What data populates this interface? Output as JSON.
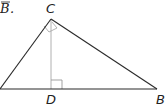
{
  "caption_fragment": {
    "letter": "B",
    "punct": "."
  },
  "points": {
    "C": {
      "label": "C"
    },
    "D": {
      "label": "D"
    },
    "B": {
      "label": "B"
    }
  },
  "colors": {
    "side": "#2a2a2a",
    "altitude": "#b0b0b0",
    "right_angle_marker": "#999999"
  }
}
